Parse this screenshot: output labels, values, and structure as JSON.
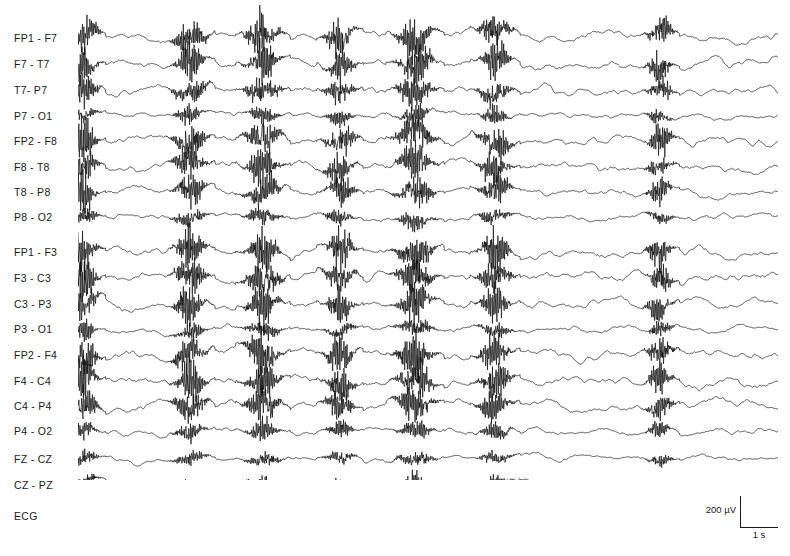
{
  "figure": {
    "kind": "eeg-recording",
    "background_color": "#ffffff",
    "trace_color": "#111111"
  },
  "channels": [
    {
      "label": "FP1 - F7",
      "y": 38,
      "group": "left-temporal",
      "type": "eeg"
    },
    {
      "label": "F7 - T7",
      "y": 64,
      "group": "left-temporal",
      "type": "eeg"
    },
    {
      "label": "T7- P7",
      "y": 90,
      "group": "left-temporal",
      "type": "eeg"
    },
    {
      "label": "P7 - O1",
      "y": 116,
      "group": "left-temporal",
      "type": "eeg"
    },
    {
      "label": "FP2 - F8",
      "y": 141,
      "group": "right-temporal",
      "type": "eeg"
    },
    {
      "label": "F8 - T8",
      "y": 167,
      "group": "right-temporal",
      "type": "eeg"
    },
    {
      "label": "T8 - P8",
      "y": 192,
      "group": "right-temporal",
      "type": "eeg"
    },
    {
      "label": "P8 - O2",
      "y": 217,
      "group": "right-temporal",
      "type": "eeg"
    },
    {
      "label": "FP1 - F3",
      "y": 252,
      "group": "left-parasag",
      "type": "eeg"
    },
    {
      "label": "F3 - C3",
      "y": 278,
      "group": "left-parasag",
      "type": "eeg"
    },
    {
      "label": "C3 - P3",
      "y": 304,
      "group": "left-parasag",
      "type": "eeg"
    },
    {
      "label": "P3 - O1",
      "y": 329,
      "group": "left-parasag",
      "type": "eeg"
    },
    {
      "label": "FP2 - F4",
      "y": 355,
      "group": "right-parasag",
      "type": "eeg"
    },
    {
      "label": "F4 - C4",
      "y": 381,
      "group": "right-parasag",
      "type": "eeg"
    },
    {
      "label": "C4 - P4",
      "y": 406,
      "group": "right-parasag",
      "type": "eeg"
    },
    {
      "label": "P4 - O2",
      "y": 431,
      "group": "right-parasag",
      "type": "eeg"
    },
    {
      "label": "FZ - CZ",
      "y": 459,
      "group": "midline",
      "type": "eeg"
    },
    {
      "label": "CZ - PZ",
      "y": 485,
      "group": "midline",
      "type": "eeg"
    },
    {
      "label": "ECG",
      "y": 516,
      "group": "ecg",
      "type": "ecg"
    }
  ],
  "calibration": {
    "amplitude_label": "200 µV",
    "time_label": "1 s",
    "amplitude_value": 200,
    "amplitude_unit": "µV",
    "time_value": 1,
    "time_unit": "s"
  },
  "chart_data": {
    "type": "line",
    "title": "",
    "xlabel": "",
    "ylabel": "",
    "n_channels": 19,
    "n_eeg_channels": 18,
    "trace_span_px": [
      78,
      778
    ],
    "duration_seconds": 18.4,
    "seconds_per_pixel": 0.0263,
    "scale_uv_per_px": 6.25,
    "burst_events": [
      {
        "index": 1,
        "center_x": 84,
        "half_width": 12,
        "amplitude": 1.0
      },
      {
        "index": 2,
        "center_x": 190,
        "half_width": 14,
        "amplitude": 0.95
      },
      {
        "index": 3,
        "center_x": 263,
        "half_width": 15,
        "amplitude": 1.0
      },
      {
        "index": 4,
        "center_x": 340,
        "half_width": 13,
        "amplitude": 0.85
      },
      {
        "index": 5,
        "center_x": 415,
        "half_width": 16,
        "amplitude": 1.0
      },
      {
        "index": 6,
        "center_x": 495,
        "half_width": 14,
        "amplitude": 0.9
      },
      {
        "index": 7,
        "center_x": 660,
        "half_width": 11,
        "amplitude": 0.8
      }
    ],
    "channel_gains": [
      1.0,
      0.92,
      0.8,
      0.42,
      1.0,
      0.88,
      0.78,
      0.45,
      1.0,
      0.95,
      0.9,
      0.45,
      1.0,
      0.95,
      0.88,
      0.46,
      0.4,
      0.38
    ],
    "ecg": {
      "beats": 30,
      "rr_interval_px": 23.5,
      "qrs_amplitude_px": 9
    },
    "legend": [],
    "grid": false
  }
}
